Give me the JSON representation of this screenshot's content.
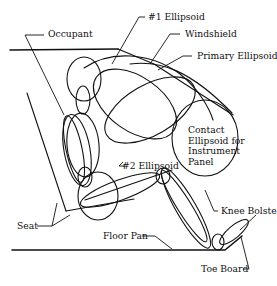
{
  "figure": {
    "type": "diagram",
    "labels": {
      "ellipsoid1": "#1 Ellipsoid",
      "occupant": "Occupant",
      "windshield": "Windshield",
      "primary_ellipsoid": "Primary Ellipsoid",
      "contact_ellipsoid": "Contact\nEllipsoid for\nInstrument\nPanel",
      "ellipsoid2": "#2 Ellipsoid",
      "seat": "Seat",
      "knee_bolster": "Knee Bolster",
      "floor_pan": "Floor Pan",
      "toe_board": "Toe Board"
    },
    "colors": {
      "line": "#111111",
      "background": "#ffffff"
    }
  }
}
